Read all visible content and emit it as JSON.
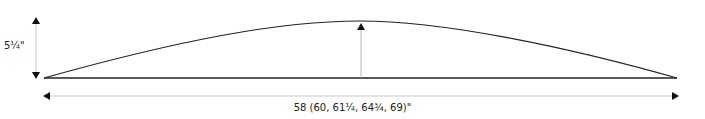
{
  "diagram": {
    "shape": "curved-panel-schematic",
    "height_label": "5¼\"",
    "width_label": "58 (60, 61¼, 64¾, 69)\"",
    "colors": {
      "line": "#222222",
      "dimension_line": "#bbbbbb"
    }
  }
}
